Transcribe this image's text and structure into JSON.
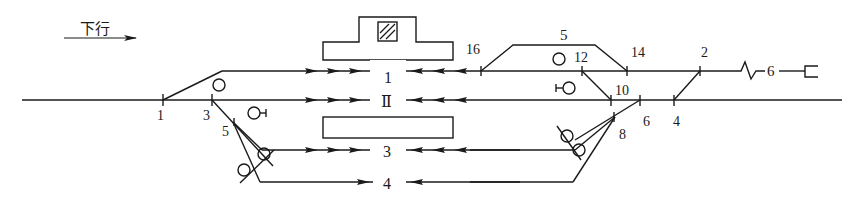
{
  "direction": {
    "label": "下行",
    "arrow": "right"
  },
  "tracks": [
    {
      "id": "1",
      "label": "1"
    },
    {
      "id": "II",
      "label": "Ⅱ"
    },
    {
      "id": "3",
      "label": "3"
    },
    {
      "id": "4",
      "label": "4"
    },
    {
      "id": "5",
      "label": "5"
    },
    {
      "id": "6",
      "label": "6"
    }
  ],
  "switches_left": [
    {
      "label": "1"
    },
    {
      "label": "3"
    },
    {
      "label": "5"
    }
  ],
  "switches_right": [
    {
      "label": "16"
    },
    {
      "label": "12"
    },
    {
      "label": "14"
    },
    {
      "label": "2"
    },
    {
      "label": "10"
    },
    {
      "label": "6"
    },
    {
      "label": "4"
    },
    {
      "label": "8"
    }
  ],
  "buildings": [
    {
      "name": "station-building"
    },
    {
      "name": "platform"
    }
  ],
  "colors": {
    "line": "#1a1a1a",
    "background": "#ffffff"
  }
}
